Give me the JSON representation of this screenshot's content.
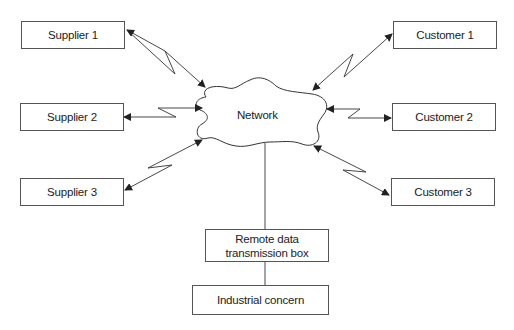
{
  "diagram": {
    "type": "network-topology",
    "center": {
      "label": "Network",
      "shape": "cloud"
    },
    "suppliers": [
      {
        "label": "Supplier 1"
      },
      {
        "label": "Supplier 2"
      },
      {
        "label": "Supplier 3"
      }
    ],
    "customers": [
      {
        "label": "Customer 1"
      },
      {
        "label": "Customer 2"
      },
      {
        "label": "Customer 3"
      }
    ],
    "remote_box": {
      "label_line1": "Remote data",
      "label_line2": "transmission box"
    },
    "industrial": {
      "label": "Industrial concern"
    },
    "connections": [
      {
        "from": "Supplier 1",
        "to": "Network",
        "style": "lightning-bidirectional"
      },
      {
        "from": "Supplier 2",
        "to": "Network",
        "style": "lightning-bidirectional"
      },
      {
        "from": "Supplier 3",
        "to": "Network",
        "style": "lightning-bidirectional"
      },
      {
        "from": "Customer 1",
        "to": "Network",
        "style": "lightning-bidirectional"
      },
      {
        "from": "Customer 2",
        "to": "Network",
        "style": "lightning-bidirectional"
      },
      {
        "from": "Customer 3",
        "to": "Network",
        "style": "lightning-bidirectional"
      },
      {
        "from": "Network",
        "to": "Remote data transmission box",
        "style": "line"
      },
      {
        "from": "Remote data transmission box",
        "to": "Industrial concern",
        "style": "line"
      }
    ],
    "colors": {
      "line": "#333333",
      "background": "#ffffff"
    }
  }
}
